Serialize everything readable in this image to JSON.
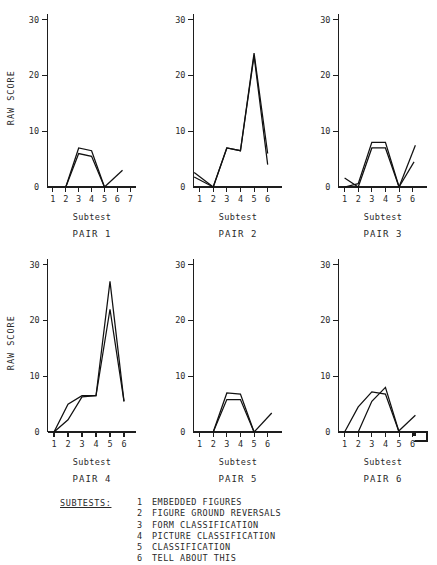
{
  "figure": {
    "y_axis_label": "RAW SCORE",
    "x_axis_label": "Subtest"
  },
  "legend": {
    "heading": "SUBTESTS:",
    "items": [
      {
        "num": "1",
        "text": "EMBEDDED  FIGURES"
      },
      {
        "num": "2",
        "text": "FIGURE GROUND REVERSALS"
      },
      {
        "num": "3",
        "text": "FORM  CLASSIFICATION"
      },
      {
        "num": "4",
        "text": "PICTURE  CLASSIFICATION"
      },
      {
        "num": "5",
        "text": "CLASSIFICATION"
      },
      {
        "num": "6",
        "text": "TELL  ABOUT  THIS"
      }
    ]
  },
  "panels": [
    {
      "caption": "PAIR 1",
      "x_label": "Subtest",
      "y_label": "RAW SCORE",
      "show_y_label": true,
      "y_ticks": [
        "0",
        "10",
        "20",
        "30"
      ],
      "x_ticks": [
        "1",
        "2",
        "3",
        "4",
        "5",
        "6",
        "7"
      ]
    },
    {
      "caption": "PAIR 2",
      "x_label": "Subtest",
      "y_label": "",
      "show_y_label": false,
      "y_ticks": [
        "0",
        "10",
        "20",
        "30"
      ],
      "x_ticks": [
        "1",
        "2",
        "3",
        "4",
        "5",
        "6"
      ]
    },
    {
      "caption": "PAIR 3",
      "x_label": "Subtest",
      "y_label": "",
      "show_y_label": false,
      "y_ticks": [
        "0",
        "10",
        "20",
        "30"
      ],
      "x_ticks": [
        "1",
        "2",
        "3",
        "4",
        "5",
        "6"
      ]
    },
    {
      "caption": "PAIR 4",
      "x_label": "Subtest",
      "y_label": "RAW SCORE",
      "show_y_label": true,
      "y_ticks": [
        "0",
        "10",
        "20",
        "30"
      ],
      "x_ticks": [
        "1",
        "2",
        "3",
        "4",
        "5",
        "6"
      ]
    },
    {
      "caption": "PAIR 5",
      "x_label": "Subtest",
      "y_label": "",
      "show_y_label": false,
      "y_ticks": [
        "0",
        "10",
        "20",
        "30"
      ],
      "x_ticks": [
        "1",
        "2",
        "3",
        "4",
        "5",
        "6"
      ]
    },
    {
      "caption": "PAIR 6",
      "x_label": "Subtest",
      "y_label": "",
      "show_y_label": false,
      "y_ticks": [
        "0",
        "10",
        "20",
        "30"
      ],
      "x_ticks": [
        "1",
        "2",
        "3",
        "4",
        "5",
        "6"
      ]
    }
  ],
  "chart_data": [
    {
      "type": "line",
      "title": "PAIR 1",
      "xlabel": "Subtest",
      "ylabel": "RAW SCORE",
      "xlim": [
        0,
        7.6
      ],
      "ylim": [
        0,
        31
      ],
      "yticks": [
        0,
        10,
        20,
        30
      ],
      "xticks": [
        1,
        2,
        3,
        4,
        5,
        6,
        7
      ],
      "grid": false,
      "legend": "none",
      "series": [
        {
          "name": "member A",
          "x": [
            2,
            3,
            4,
            5
          ],
          "values": [
            0,
            7,
            6.5,
            0
          ]
        },
        {
          "name": "member B",
          "x": [
            2,
            3,
            4,
            5
          ],
          "values": [
            0,
            6,
            5.5,
            0
          ]
        },
        {
          "name": "tail",
          "x": [
            5,
            6.4
          ],
          "values": [
            0,
            3
          ]
        }
      ]
    },
    {
      "type": "line",
      "title": "PAIR 2",
      "xlabel": "Subtest",
      "ylabel": "",
      "xlim": [
        0,
        7.2
      ],
      "ylim": [
        0,
        31
      ],
      "yticks": [
        0,
        10,
        20,
        30
      ],
      "xticks": [
        1,
        2,
        3,
        4,
        5,
        6
      ],
      "grid": false,
      "legend": "none",
      "series": [
        {
          "name": "member A",
          "x": [
            2,
            3,
            4,
            5,
            6
          ],
          "values": [
            0,
            7,
            6.5,
            24,
            6
          ]
        },
        {
          "name": "member B",
          "x": [
            2,
            3,
            4,
            5,
            6
          ],
          "values": [
            0,
            7,
            6.5,
            23.5,
            4
          ]
        },
        {
          "name": "lead-in upper",
          "x": [
            0.6,
            2
          ],
          "values": [
            2.6,
            0
          ]
        },
        {
          "name": "lead-in lower",
          "x": [
            0.6,
            2
          ],
          "values": [
            1.8,
            0
          ]
        }
      ]
    },
    {
      "type": "line",
      "title": "PAIR 3",
      "xlabel": "Subtest",
      "ylabel": "",
      "xlim": [
        0,
        7.2
      ],
      "ylim": [
        0,
        31
      ],
      "yticks": [
        0,
        10,
        20,
        30
      ],
      "xticks": [
        1,
        2,
        3,
        4,
        5,
        6
      ],
      "grid": false,
      "legend": "none",
      "series": [
        {
          "name": "member A",
          "x": [
            1,
            2,
            3,
            4,
            5
          ],
          "values": [
            0,
            0.6,
            8,
            8,
            0
          ]
        },
        {
          "name": "member B",
          "x": [
            1,
            2,
            3,
            4,
            5
          ],
          "values": [
            1.6,
            0,
            7,
            7,
            0
          ]
        },
        {
          "name": "tail upper",
          "x": [
            5,
            6.2
          ],
          "values": [
            0,
            7.5
          ]
        },
        {
          "name": "tail lower",
          "x": [
            5,
            6.1
          ],
          "values": [
            0,
            4.5
          ]
        }
      ]
    },
    {
      "type": "line",
      "title": "PAIR 4",
      "xlabel": "Subtest",
      "ylabel": "RAW SCORE",
      "xlim": [
        0,
        7.0
      ],
      "ylim": [
        0,
        31
      ],
      "yticks": [
        0,
        10,
        20,
        30
      ],
      "xticks": [
        1,
        2,
        3,
        4,
        5,
        6
      ],
      "grid": false,
      "legend": "none",
      "series": [
        {
          "name": "member A",
          "x": [
            1,
            2,
            3,
            4,
            5,
            6
          ],
          "values": [
            0,
            5,
            6.5,
            6.5,
            27,
            5.5
          ]
        },
        {
          "name": "member B",
          "x": [
            1,
            2,
            3,
            4,
            5,
            6
          ],
          "values": [
            0,
            2.2,
            6.3,
            6.5,
            22,
            5.5
          ]
        }
      ]
    },
    {
      "type": "line",
      "title": "PAIR 5",
      "xlabel": "Subtest",
      "ylabel": "",
      "xlim": [
        0,
        7.2
      ],
      "ylim": [
        0,
        31
      ],
      "yticks": [
        0,
        10,
        20,
        30
      ],
      "xticks": [
        1,
        2,
        3,
        4,
        5,
        6
      ],
      "grid": false,
      "legend": "none",
      "series": [
        {
          "name": "member A",
          "x": [
            2,
            3,
            4,
            5
          ],
          "values": [
            0,
            7,
            6.8,
            0
          ]
        },
        {
          "name": "member B",
          "x": [
            2,
            3,
            4,
            5
          ],
          "values": [
            0,
            5.8,
            5.8,
            0
          ]
        },
        {
          "name": "tail",
          "x": [
            5,
            6.3
          ],
          "values": [
            0,
            3.4
          ]
        }
      ]
    },
    {
      "type": "line",
      "title": "PAIR 6",
      "xlabel": "Subtest",
      "ylabel": "",
      "xlim": [
        0,
        7.2
      ],
      "ylim": [
        0,
        31
      ],
      "yticks": [
        0,
        10,
        20,
        30
      ],
      "xticks": [
        1,
        2,
        3,
        4,
        5,
        6
      ],
      "grid": false,
      "legend": "none",
      "series": [
        {
          "name": "member A",
          "x": [
            1,
            2,
            3,
            4,
            5
          ],
          "values": [
            0,
            4.5,
            7.2,
            6.8,
            0
          ]
        },
        {
          "name": "member B",
          "x": [
            2,
            3,
            4,
            5
          ],
          "values": [
            0,
            5.5,
            8,
            0
          ]
        },
        {
          "name": "tail",
          "x": [
            4.9,
            6.2
          ],
          "values": [
            0,
            3
          ]
        }
      ]
    }
  ]
}
